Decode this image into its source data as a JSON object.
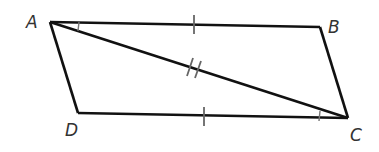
{
  "diagram": {
    "type": "parallelogram",
    "vertices": [
      {
        "label": "A",
        "x": 50,
        "y": 22
      },
      {
        "label": "B",
        "x": 320,
        "y": 27
      },
      {
        "label": "C",
        "x": 348,
        "y": 118
      },
      {
        "label": "D",
        "x": 78,
        "y": 113
      }
    ],
    "segments": [
      "AB",
      "BC",
      "CD",
      "DA",
      "AC"
    ],
    "marks": {
      "AB": "single tick",
      "DC": "single tick",
      "AC": "double tick",
      "angle_BAC": "single arc tick",
      "angle_DCA": "single arc tick"
    },
    "colors": {
      "line": "#111111",
      "label": "#333333",
      "tick": "#555555"
    }
  },
  "labels": {
    "A": "A",
    "B": "B",
    "C": "C",
    "D": "D"
  }
}
